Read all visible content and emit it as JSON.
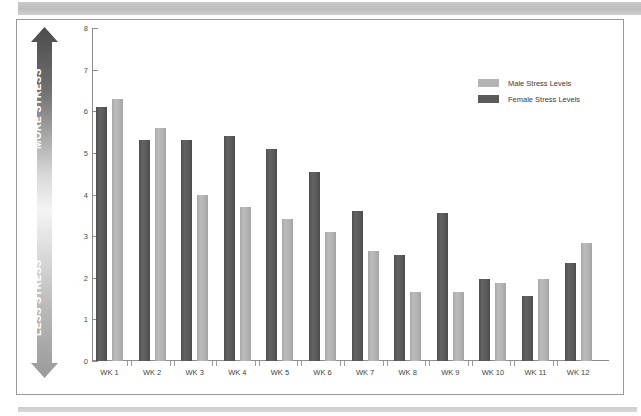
{
  "chart_data": {
    "type": "bar",
    "title": "",
    "xlabel": "",
    "ylabel": "",
    "ylim": [
      0,
      8
    ],
    "yticks": [
      0,
      1,
      2,
      3,
      4,
      5,
      6,
      7,
      8
    ],
    "grid": false,
    "legend_position": "top-right",
    "categories": [
      "WK 1",
      "WK 2",
      "WK 3",
      "WK 4",
      "WK 5",
      "WK 6",
      "WK 7",
      "WK 8",
      "WK 9",
      "WK 10",
      "WK 11",
      "WK 12"
    ],
    "series": [
      {
        "name": "Male Stress Levels",
        "color": "#b4b4b4",
        "values": [
          6.3,
          5.6,
          4.0,
          3.7,
          3.4,
          3.1,
          2.65,
          1.67,
          1.67,
          1.88,
          1.97,
          2.83
        ]
      },
      {
        "name": "Female Stress Levels",
        "color": "#5b5b5b",
        "values": [
          6.1,
          5.3,
          5.3,
          5.4,
          5.1,
          4.55,
          3.6,
          2.55,
          3.55,
          1.97,
          1.57,
          2.35
        ]
      }
    ],
    "annotations": {
      "axis_arrow_top": "MORE STRESS",
      "axis_arrow_bottom": "LESS STRESS"
    }
  },
  "legend": {
    "items": [
      {
        "label": "Male Stress Levels",
        "swatch": "male"
      },
      {
        "label": "Female Stress Levels",
        "swatch": "female"
      }
    ]
  },
  "stress_arrow": {
    "more": "MORE STRESS",
    "less": "LESS STRESS"
  }
}
